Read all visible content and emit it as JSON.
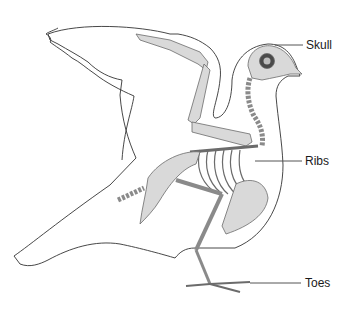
{
  "figure": {
    "labels": [
      {
        "id": "skull",
        "text": "Skull"
      },
      {
        "id": "ribs",
        "text": "Ribs"
      },
      {
        "id": "toes",
        "text": "Toes"
      }
    ],
    "colors": {
      "outline": "#333333",
      "bone_fill": "#d9d9d9",
      "bone_stroke": "#6b6b6b",
      "leader_line": "#555555",
      "label_text": "#1a1a1a"
    }
  }
}
